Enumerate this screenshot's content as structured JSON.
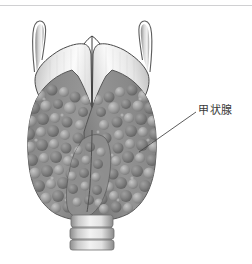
{
  "figure": {
    "type": "anatomical-illustration",
    "view": "anterior",
    "rendering": "grayscale-medical-illustration",
    "background_color": "#ffffff",
    "divider_color": "#d0d0d2",
    "annotations": [
      {
        "id": "thyroid-gland",
        "label": "甲状腺",
        "label_x": 198,
        "label_y": 104,
        "leader_from_x": 196,
        "leader_from_y": 112,
        "leader_to_x": 139,
        "leader_to_y": 152,
        "line_color": "#4a4a4a"
      }
    ],
    "structures": [
      {
        "name": "superior-horn-left",
        "description": "甲状软骨上角（左）",
        "color": "#cfcfcf"
      },
      {
        "name": "superior-horn-right",
        "description": "甲状软骨上角（右）",
        "color": "#cfcfcf"
      },
      {
        "name": "thyroid-cartilage",
        "description": "甲状软骨",
        "color": "#eeeeee"
      },
      {
        "name": "cricothyroid-muscle",
        "description": "环甲肌",
        "color": "#9a9a9a"
      },
      {
        "name": "thyroid-lobe-left",
        "description": "甲状腺左叶",
        "color": "#8b8b8b"
      },
      {
        "name": "thyroid-lobe-right",
        "description": "甲状腺右叶",
        "color": "#8b8b8b"
      },
      {
        "name": "thyroid-isthmus",
        "description": "甲状腺峡",
        "color": "#909090"
      },
      {
        "name": "trachea",
        "description": "气管软骨环",
        "color": "#e2e2e2",
        "ring_count": 3
      }
    ]
  }
}
